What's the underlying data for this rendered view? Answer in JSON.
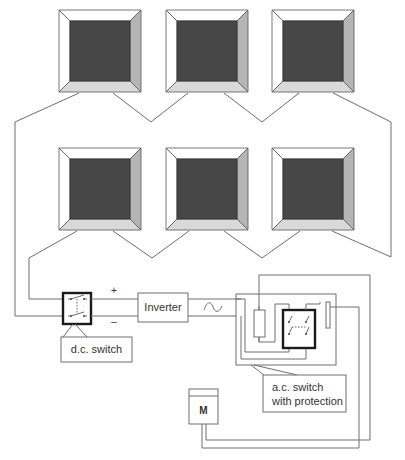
{
  "diagram": {
    "title": "",
    "panels": {
      "rows": [
        [
          {
            "x": 59,
            "y": 10,
            "size": 82
          },
          {
            "x": 166,
            "y": 10,
            "size": 82
          },
          {
            "x": 272,
            "y": 10,
            "size": 82
          }
        ],
        [
          {
            "x": 59,
            "y": 148,
            "size": 82
          },
          {
            "x": 166,
            "y": 148,
            "size": 82
          },
          {
            "x": 272,
            "y": 148,
            "size": 82
          }
        ]
      ],
      "colors": {
        "cell": "#474747",
        "bevel_top": "#ffffff",
        "bevel_left": "#ffffff",
        "bevel_right": "#b5b5b5",
        "bevel_bottom": "#d9d9d9",
        "outline": "#555555"
      }
    },
    "dc_bus": {
      "plus_label": "+",
      "minus_label": "–"
    },
    "dc_switch": {
      "label": "d.c. switch"
    },
    "inverter": {
      "label": "Inverter",
      "output_symbol": "~"
    },
    "ac_switch": {
      "label_line1": "a.c. switch",
      "label_line2": "with protection"
    },
    "meter": {
      "label": "M"
    }
  }
}
